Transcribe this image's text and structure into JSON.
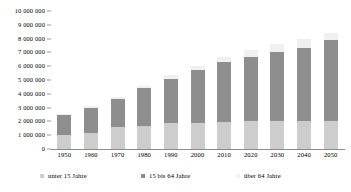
{
  "chart_data": {
    "type": "bar",
    "subtype": "stacked-bar",
    "title": "",
    "xlabel": "",
    "ylabel": "",
    "categories": [
      "1950",
      "1960",
      "1970",
      "1980",
      "1990",
      "2000",
      "2010",
      "2020",
      "2030",
      "2040",
      "2050"
    ],
    "series": [
      {
        "name": "unter 15 Jahre",
        "color": "#cdcdcd",
        "values": [
          1000000,
          1150000,
          1600000,
          1700000,
          1900000,
          1900000,
          1950000,
          2000000,
          2000000,
          2000000,
          2000000
        ]
      },
      {
        "name": "15 bis 64 Jahre",
        "color": "#8e8e8e",
        "values": [
          1450000,
          1850000,
          2000000,
          2700000,
          3200000,
          3800000,
          4350000,
          4700000,
          5000000,
          5300000,
          5900000
        ]
      },
      {
        "name": "über 64 Jahre",
        "color": "#f0f0f0",
        "values": [
          120000,
          130000,
          150000,
          200000,
          250000,
          300000,
          400000,
          500000,
          600000,
          650000,
          500000
        ]
      }
    ],
    "totals": [
      2570000,
      3130000,
      3750000,
      4600000,
      5350000,
      6000000,
      6700000,
      7200000,
      7600000,
      7950000,
      8400000
    ],
    "ylim": [
      0,
      10000000
    ],
    "ytick_values": [
      0,
      1000000,
      2000000,
      3000000,
      4000000,
      5000000,
      6000000,
      7000000,
      8000000,
      9000000,
      10000000
    ],
    "ytick_labels": [
      "0",
      "1 000 000",
      "2 000 000",
      "3 000 000",
      "4 000 000",
      "5 000 000",
      "6 000 000",
      "7 000 000",
      "8 000 000",
      "9 000 000",
      "10 000 000"
    ],
    "grid": false,
    "legend_position": "bottom",
    "legend": [
      "unter 15 Jahre",
      "15 bis 64 Jahre",
      "über 64 Jahre"
    ]
  },
  "legend": {
    "items": [
      {
        "label": "unter 15 Jahre",
        "color": "#cdcdcd",
        "left": 40
      },
      {
        "label": "15 bis 64 Jahre",
        "color": "#8e8e8e",
        "left": 141
      },
      {
        "label": "über 64 Jahre",
        "color": "#f0f0f0",
        "left": 236
      }
    ]
  }
}
